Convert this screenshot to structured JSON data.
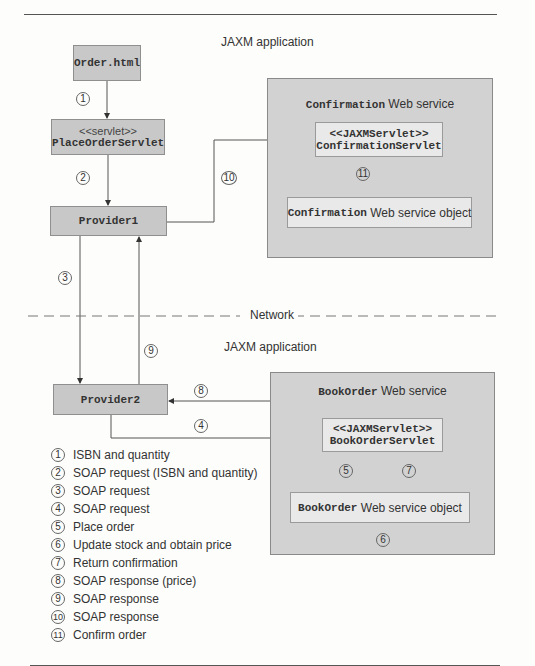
{
  "diagram": {
    "top_application_label": "JAXM application",
    "bottom_application_label": "JAXM application",
    "network_label": "Network",
    "nodes": {
      "order_html": {
        "name": "Order.html"
      },
      "place_order_servlet": {
        "stereotype": "<<servlet>>",
        "name": "PlaceOrderServlet"
      },
      "provider1": {
        "name": "Provider1"
      },
      "provider2": {
        "name": "Provider2"
      },
      "confirmation_service": {
        "title_code": "Confirmation",
        "title_text": " Web service",
        "servlet": {
          "stereotype": "<<JAXMServlet>>",
          "name": "ConfirmationServlet"
        },
        "object": {
          "code": "Confirmation",
          "text": " Web service object"
        }
      },
      "bookorder_service": {
        "title_code": "BookOrder",
        "title_text": " Web service",
        "servlet": {
          "stereotype": "<<JAXMServlet>>",
          "name": "BookOrderServlet"
        },
        "object": {
          "code": "BookOrder",
          "text": " Web service object"
        }
      }
    },
    "step_markers": [
      "1",
      "2",
      "3",
      "4",
      "5",
      "6",
      "7",
      "8",
      "9",
      "10",
      "11"
    ],
    "legend": [
      {
        "num": "1",
        "text": "ISBN and quantity"
      },
      {
        "num": "2",
        "text": "SOAP request (ISBN and quantity)"
      },
      {
        "num": "3",
        "text": "SOAP request"
      },
      {
        "num": "4",
        "text": "SOAP request"
      },
      {
        "num": "5",
        "text": "Place order"
      },
      {
        "num": "6",
        "text": "Update stock and obtain price"
      },
      {
        "num": "7",
        "text": "Return confirmation"
      },
      {
        "num": "8",
        "text": "SOAP response (price)"
      },
      {
        "num": "9",
        "text": "SOAP response"
      },
      {
        "num": "10",
        "text": "SOAP response"
      },
      {
        "num": "11",
        "text": "Confirm order"
      }
    ]
  }
}
